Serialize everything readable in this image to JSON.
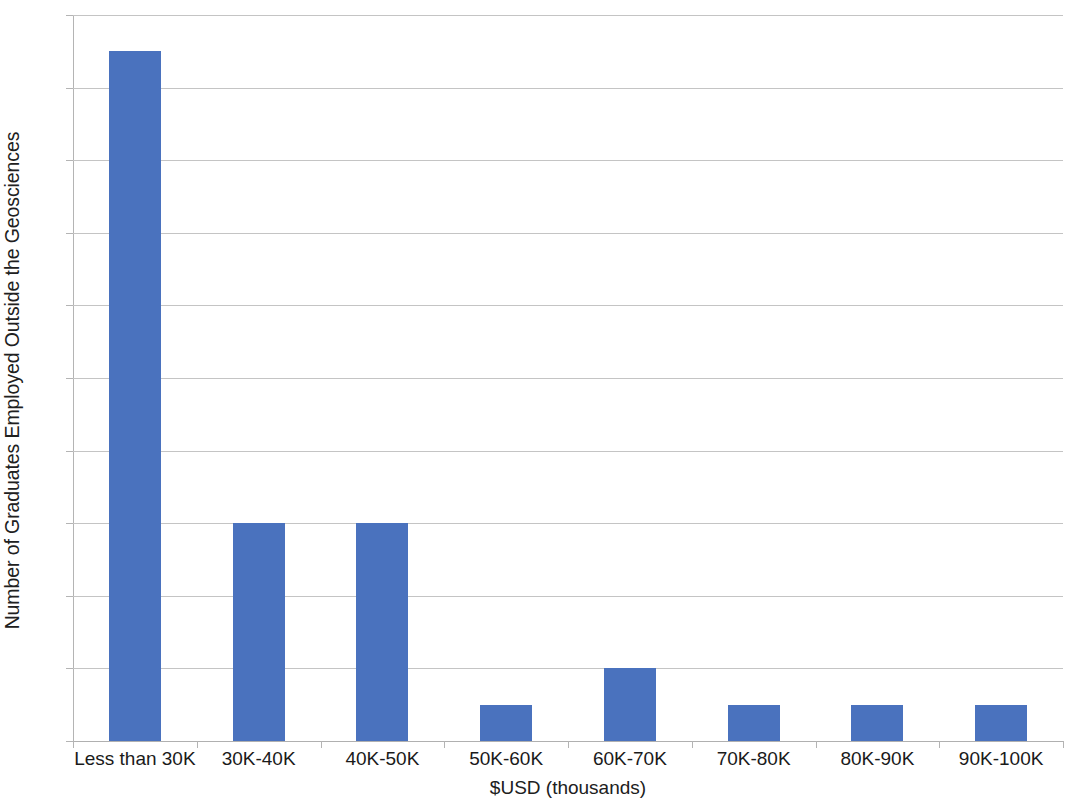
{
  "chart_data": {
    "type": "bar",
    "title": "",
    "subtitle": "",
    "xlabel": "$USD (thousands)",
    "ylabel": "Number of Graduates Employed Outside the Geosciences",
    "categories": [
      "Less than 30K",
      "30K-40K",
      "40K-50K",
      "50K-60K",
      "60K-70K",
      "70K-80K",
      "80K-90K",
      "90K-100K"
    ],
    "values": [
      19,
      6,
      6,
      1,
      2,
      1,
      1,
      1
    ],
    "ylim": [
      0,
      20
    ],
    "ytick_step": 2,
    "ytick_labels": [
      "0",
      "2",
      "4",
      "6",
      "8",
      "10",
      "12",
      "14",
      "16",
      "18",
      "20"
    ],
    "ytick_values": [
      0,
      2,
      4,
      6,
      8,
      10,
      12,
      14,
      16,
      18,
      20
    ],
    "grid": "horizontal",
    "legend": "none",
    "bar_color": "#4a72be",
    "gridline_color": "#c4c4c4",
    "axis_color": "#b4b4b4",
    "background_color": "#ffffff"
  }
}
